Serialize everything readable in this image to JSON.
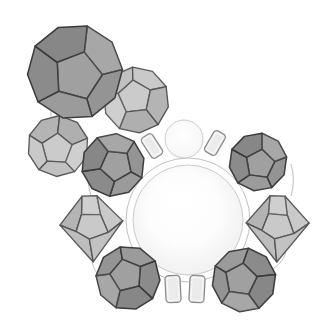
{
  "figure": {
    "label": "cluster-of-shaded-coordination-polyhedra-around-two-spheres",
    "canvas": {
      "width": 328,
      "height": 331,
      "background": "#ffffff"
    },
    "palette": {
      "dark_polyhedron_fill": "#9b9b9b",
      "dark_polyhedron_edge": "#3f3f3f",
      "light_polyhedron_fill": "#c9c9c9",
      "light_polyhedron_edge": "#5a5a5a",
      "sphere_outline": "#c6c6c6",
      "sphere_core": "#ffffff",
      "sphere_rim_large": "#d9d9d9",
      "sphere_rim_small": "#e4e4e4",
      "capsule_fill": "#ebebeb",
      "capsule_edge": "#8d8d8d",
      "capsule_inner_highlight": "#f8f8f8",
      "guide_line": "#b4b4b4"
    },
    "guides": [
      {
        "id": "coordination-ring",
        "type": "circle",
        "cx": 188,
        "cy": 220,
        "r": 62
      },
      {
        "id": "link-arc-upper-left",
        "type": "path",
        "d": "M 52,108 C 48,120 54,129 68,132"
      },
      {
        "id": "link-arc-top",
        "type": "path",
        "d": "M 104,64 C 114,60 121,68 123,81"
      },
      {
        "id": "link-arc-right",
        "type": "path",
        "d": "M 291,164 C 294,175 294,185 291,196"
      },
      {
        "id": "link-arc-lower-right",
        "type": "path",
        "d": "M 286,252 C 283,261 278,266 271,270"
      },
      {
        "id": "link-arc-left-upper",
        "type": "path",
        "d": "M 88,182 C 89,188 90,192 91,196"
      },
      {
        "id": "link-arc-left-lower",
        "type": "path",
        "d": "M 92,262 C 94,269 96,273 101,277"
      }
    ],
    "spheres": [
      {
        "id": "central-sphere-large",
        "cx": 188,
        "cy": 220,
        "r": 55,
        "gradient": "large"
      },
      {
        "id": "upper-sphere-small",
        "cx": 184,
        "cy": 139,
        "r": 19,
        "gradient": "small"
      }
    ],
    "polyhedra": [
      {
        "id": "dodecahedron-top-center",
        "view": "face",
        "tone": "light",
        "cx": 136,
        "cy": 100,
        "scale": 0.66,
        "rotation": -150
      },
      {
        "id": "dodecahedron-left",
        "view": "face",
        "tone": "light",
        "cx": 58,
        "cy": 146,
        "scale": 0.61,
        "rotation": 75
      },
      {
        "id": "dodecahedron-top-left-large",
        "view": "face",
        "tone": "dark",
        "cx": 75,
        "cy": 72,
        "scale": 0.95,
        "rotation": 15
      },
      {
        "id": "dodecahedron-center-left",
        "view": "face",
        "tone": "dark",
        "cx": 113,
        "cy": 165,
        "scale": 0.63,
        "rotation": -30
      },
      {
        "id": "dodecahedron-right-upper",
        "view": "face",
        "tone": "dark",
        "cx": 258,
        "cy": 162,
        "scale": 0.58,
        "rotation": 8
      },
      {
        "id": "bicone-left",
        "view": "edge",
        "tone": "light",
        "cx": 91,
        "cy": 227,
        "scale": 1.0,
        "rotation": -2
      },
      {
        "id": "bicone-right",
        "view": "edge",
        "tone": "light",
        "cx": 277,
        "cy": 227,
        "scale": 1.0,
        "rotation": 2
      },
      {
        "id": "dodecahedron-bottom-left",
        "view": "face",
        "tone": "dark",
        "cx": 128,
        "cy": 278,
        "scale": 0.64,
        "rotation": -158
      },
      {
        "id": "dodecahedron-bottom-right",
        "view": "face",
        "tone": "dark",
        "cx": 244,
        "cy": 280,
        "scale": 0.64,
        "rotation": 152
      }
    ],
    "capsules": [
      {
        "id": "capsule-upper-left",
        "cx": 152,
        "cy": 146,
        "w": 13,
        "h": 24,
        "rotation": -33
      },
      {
        "id": "capsule-upper-right",
        "cx": 215,
        "cy": 143,
        "w": 13,
        "h": 24,
        "rotation": 30
      },
      {
        "id": "capsule-lower-left",
        "cx": 173,
        "cy": 289,
        "w": 15,
        "h": 27,
        "rotation": -3
      },
      {
        "id": "capsule-lower-right",
        "cx": 197,
        "cy": 289,
        "w": 15,
        "h": 27,
        "rotation": 3
      }
    ]
  }
}
